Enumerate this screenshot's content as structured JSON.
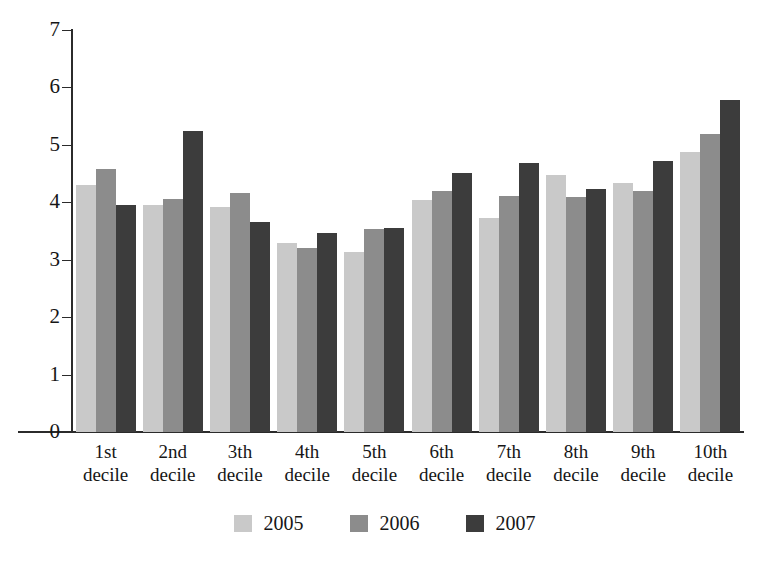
{
  "chart_data": {
    "type": "bar",
    "title": "",
    "subtitle": "",
    "xlabel": "",
    "ylabel": "",
    "ylim": [
      0,
      7
    ],
    "ytick_labels": [
      "7",
      "6",
      "5",
      "4",
      "3",
      "2",
      "1",
      "0"
    ],
    "yticks": [
      7,
      6,
      5,
      4,
      3,
      2,
      1,
      0
    ],
    "grid": false,
    "legend_position": "bottom-center",
    "categories": [
      "1st decile",
      "2nd decile",
      "3th decile",
      "4th decile",
      "5th decile",
      "6th decile",
      "7th decile",
      "8th decile",
      "9th decile",
      "10th decile"
    ],
    "category_lines": [
      [
        "1st",
        "decile"
      ],
      [
        "2nd",
        "decile"
      ],
      [
        "3th",
        "decile"
      ],
      [
        "4th",
        "decile"
      ],
      [
        "5th",
        "decile"
      ],
      [
        "6th",
        "decile"
      ],
      [
        "7th",
        "decile"
      ],
      [
        "8th",
        "decile"
      ],
      [
        "9th",
        "decile"
      ],
      [
        "10th",
        "decile"
      ]
    ],
    "series": [
      {
        "name": "2005",
        "color": "#c9c9c9",
        "values": [
          4.3,
          3.95,
          3.92,
          3.3,
          3.13,
          4.04,
          3.72,
          4.47,
          4.33,
          4.88
        ]
      },
      {
        "name": "2006",
        "color": "#8c8c8c",
        "values": [
          4.58,
          4.05,
          4.16,
          3.2,
          3.54,
          4.19,
          4.11,
          4.1,
          4.2,
          5.19
        ]
      },
      {
        "name": "2007",
        "color": "#3c3c3c",
        "values": [
          3.95,
          5.24,
          3.65,
          3.47,
          3.56,
          4.51,
          4.69,
          4.23,
          4.72,
          5.79
        ]
      }
    ]
  },
  "legend": {
    "items": [
      {
        "label": "2005",
        "color": "#c9c9c9"
      },
      {
        "label": "2006",
        "color": "#8c8c8c"
      },
      {
        "label": "2007",
        "color": "#3c3c3c"
      }
    ]
  },
  "axis": {
    "y_max_label": "7",
    "y_min_label": "0"
  }
}
